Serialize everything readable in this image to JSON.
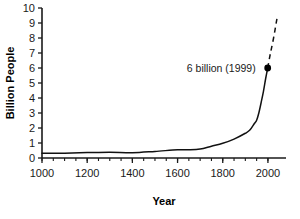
{
  "chart_data": {
    "type": "line",
    "title": "",
    "xlabel": "Year",
    "ylabel": "Billion People",
    "xlim": [
      1000,
      2080
    ],
    "ylim": [
      0,
      10
    ],
    "grid": false,
    "legend": null,
    "x_ticks": [
      1000,
      1200,
      1400,
      1600,
      1800,
      2000
    ],
    "x_tick_labels": [
      "1000",
      "1200",
      "1400",
      "1600",
      "1800",
      "2000"
    ],
    "x_minor_tick_interval": 50,
    "y_ticks": [
      0,
      1,
      2,
      3,
      4,
      5,
      6,
      7,
      8,
      9,
      10
    ],
    "y_tick_labels": [
      "0",
      "1",
      "2",
      "3",
      "4",
      "5",
      "6",
      "7",
      "8",
      "9",
      "10"
    ],
    "series": [
      {
        "name": "World population (historical)",
        "style": "solid",
        "x": [
          1000,
          1100,
          1200,
          1300,
          1400,
          1500,
          1600,
          1650,
          1700,
          1750,
          1800,
          1850,
          1900,
          1920,
          1940,
          1950,
          1960,
          1970,
          1980,
          1990,
          1999
        ],
        "values": [
          0.31,
          0.32,
          0.36,
          0.39,
          0.35,
          0.44,
          0.55,
          0.55,
          0.6,
          0.79,
          0.98,
          1.26,
          1.65,
          1.86,
          2.3,
          2.52,
          3.02,
          3.7,
          4.43,
          5.3,
          6.0
        ]
      },
      {
        "name": "Projection",
        "style": "dashed",
        "x": [
          1999,
          2010,
          2025,
          2040
        ],
        "values": [
          6.0,
          6.9,
          8.0,
          9.3
        ]
      }
    ],
    "annotations": [
      {
        "label": "6 billion (1999)",
        "point_x": 1999,
        "point_y": 6.0,
        "marker": "filled-circle"
      }
    ]
  }
}
